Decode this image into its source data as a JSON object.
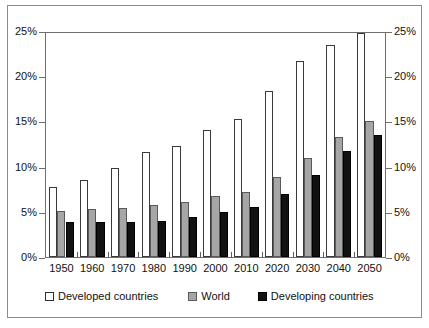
{
  "chart_data": {
    "type": "bar",
    "title": "",
    "subtitle": "",
    "xlabel": "",
    "ylabel": "",
    "ylim": [
      0,
      25
    ],
    "yticks": [
      0,
      5,
      10,
      15,
      20,
      25
    ],
    "ytick_labels": [
      "0%",
      "5%",
      "10%",
      "15%",
      "20%",
      "25%"
    ],
    "right_axis": true,
    "right_ytick_labels": [
      "0%",
      "5%",
      "10%",
      "15%",
      "20%",
      "25%"
    ],
    "grid": false,
    "legend_position": "bottom",
    "unit": "%",
    "categories": [
      "1950",
      "1960",
      "1970",
      "1980",
      "1990",
      "2000",
      "2010",
      "2020",
      "2030",
      "2040",
      "2050"
    ],
    "series": [
      {
        "name": "Developed countries",
        "color": "#ffffff",
        "edge_color": "#3a3a3a",
        "values": [
          7.8,
          8.5,
          9.9,
          11.6,
          12.3,
          14.1,
          15.3,
          18.4,
          21.7,
          23.5,
          24.8
        ]
      },
      {
        "name": "World",
        "color": "#a6a6a6",
        "edge_color": "#5a5a5a",
        "values": [
          5.1,
          5.3,
          5.4,
          5.8,
          6.1,
          6.7,
          7.2,
          8.8,
          11.0,
          13.3,
          15.0
        ]
      },
      {
        "name": "Developing countries",
        "color": "#121212",
        "edge_color": "#000000",
        "values": [
          3.9,
          3.9,
          3.9,
          4.0,
          4.4,
          5.0,
          5.5,
          7.0,
          9.1,
          11.7,
          13.5
        ]
      }
    ]
  },
  "legend": {
    "items": [
      {
        "label": "Developed countries",
        "swatch": "white-square-icon"
      },
      {
        "label": "World",
        "swatch": "gray-square-icon"
      },
      {
        "label": "Developing countries",
        "swatch": "black-square-icon"
      }
    ]
  }
}
